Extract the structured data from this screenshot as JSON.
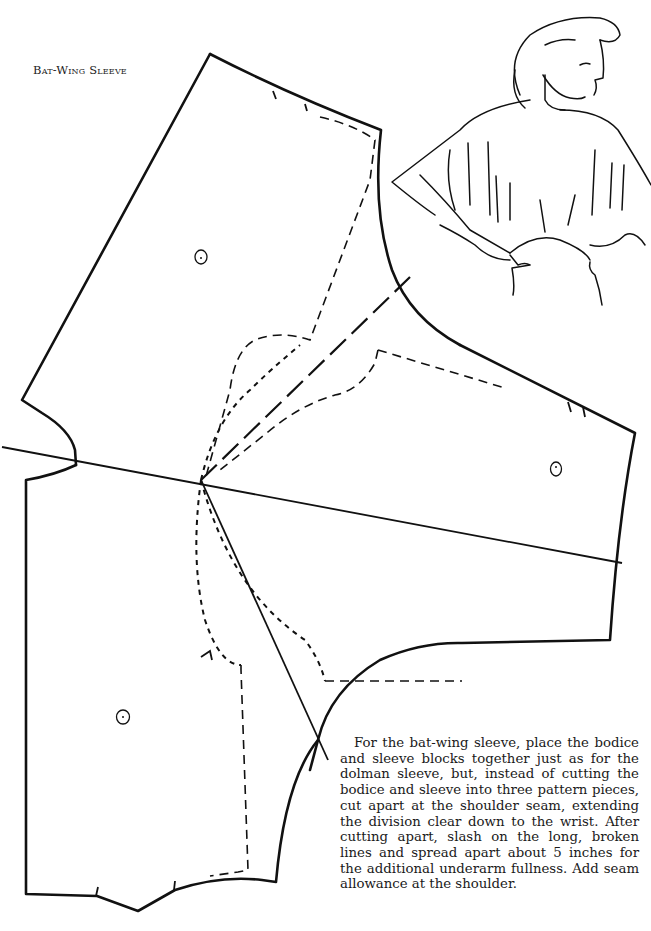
{
  "title": "Bat-Wing Sleeve",
  "caption": "For the bat-wing sleeve, place the bodice and sleeve blocks together just as for the dolman sleeve, but, instead of cutting the bodice and sleeve into three pattern pieces, cut apart at the shoulder seam, extending the division clear down to the wrist. After cutting apart, slash on the long, broken lines and spread apart about 5 inches for the additional underarm fullness. Add seam allowance at the shoulder.",
  "diagram": {
    "pieces": [
      "bodice-back-block",
      "sleeve-block",
      "bodice-front-block"
    ],
    "line_styles": {
      "cutting_line": "solid",
      "original_outline": "dashed",
      "slash_line": "long-dashed"
    },
    "grain_markers": 3,
    "illustration": "woman wearing bat-wing sleeve blouse with gathered waist"
  }
}
